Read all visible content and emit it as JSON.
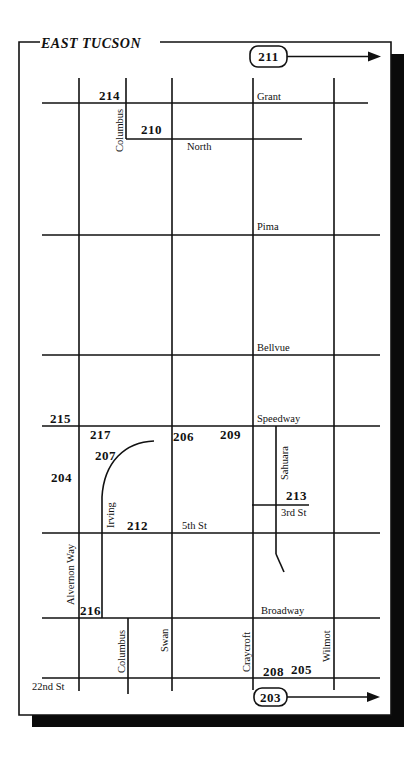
{
  "map": {
    "title": "EAST TUCSON",
    "route_badges": [
      {
        "id": "211",
        "label": "211",
        "x": 250,
        "y": 46,
        "w": 37,
        "h": 21,
        "arrow_to": 381
      },
      {
        "id": "203",
        "label": "203",
        "x": 254,
        "y": 688,
        "w": 33,
        "h": 18,
        "arrow_to": 380
      }
    ],
    "horizontal_streets": [
      {
        "name": "Grant",
        "y": 103,
        "x1": 42,
        "x2": 368,
        "label_x": 257,
        "label_y": 100
      },
      {
        "name": "North",
        "y": 139,
        "x1": 126,
        "x2": 302,
        "label_x": 187,
        "label_y": 150
      },
      {
        "name": "Pima",
        "y": 235,
        "x1": 42,
        "x2": 380,
        "label_x": 257,
        "label_y": 230
      },
      {
        "name": "Bellvue",
        "y": 355,
        "x1": 42,
        "x2": 380,
        "label_x": 257,
        "label_y": 351
      },
      {
        "name": "Speedway",
        "y": 426,
        "x1": 42,
        "x2": 380,
        "label_x": 257,
        "label_y": 422
      },
      {
        "name": "3rd St",
        "y": 505,
        "x1": 252,
        "x2": 309,
        "label_x": 281,
        "label_y": 516
      },
      {
        "name": "5th St",
        "y": 533,
        "x1": 42,
        "x2": 380,
        "label_x": 182,
        "label_y": 529
      },
      {
        "name": "Broadway",
        "y": 618,
        "x1": 42,
        "x2": 380,
        "label_x": 261,
        "label_y": 614
      },
      {
        "name": "22nd St",
        "y": 678,
        "x1": 42,
        "x2": 380,
        "label_x": 32,
        "label_y": 690
      }
    ],
    "vertical_streets": [
      {
        "name": "Alvernon Way",
        "x": 79,
        "y1": 78,
        "y2": 691,
        "label_x": 74,
        "label_y": 605
      },
      {
        "name": "Columbus",
        "x": 126,
        "y1": 78,
        "y2": 139,
        "label_x": 123,
        "label_y": 152
      },
      {
        "name": "Columbus",
        "x": 128,
        "y1": 618,
        "y2": 694,
        "label_x": 125,
        "label_y": 673
      },
      {
        "name": "Swan",
        "x": 172,
        "y1": 78,
        "y2": 691,
        "label_x": 168,
        "label_y": 652
      },
      {
        "name": "Craycroft",
        "x": 253,
        "y1": 78,
        "y2": 690,
        "label_x": 250,
        "label_y": 672
      },
      {
        "name": "Wilmot",
        "x": 334,
        "y1": 78,
        "y2": 690,
        "label_x": 330,
        "label_y": 662
      },
      {
        "name": "Sahuara",
        "x": 276,
        "y1": 426,
        "y2": 554,
        "label_x": 288,
        "label_y": 480
      },
      {
        "name": "Irving",
        "x": 102,
        "y1": 497,
        "y2": 618,
        "label_x": 114,
        "label_y": 528
      }
    ],
    "locations": [
      {
        "id": "214",
        "x": 99,
        "y": 100
      },
      {
        "id": "210",
        "x": 141,
        "y": 134
      },
      {
        "id": "215",
        "x": 50,
        "y": 423
      },
      {
        "id": "217",
        "x": 90,
        "y": 439
      },
      {
        "id": "206",
        "x": 173,
        "y": 441
      },
      {
        "id": "209",
        "x": 220,
        "y": 439
      },
      {
        "id": "207",
        "x": 95,
        "y": 460
      },
      {
        "id": "204",
        "x": 51,
        "y": 482
      },
      {
        "id": "213",
        "x": 286,
        "y": 500
      },
      {
        "id": "212",
        "x": 127,
        "y": 530
      },
      {
        "id": "216",
        "x": 80,
        "y": 615
      },
      {
        "id": "208",
        "x": 263,
        "y": 676
      },
      {
        "id": "205",
        "x": 291,
        "y": 674
      }
    ],
    "colors": {
      "ink": "#111111",
      "shadow": "#0a0a0a",
      "paper": "#ffffff"
    }
  }
}
